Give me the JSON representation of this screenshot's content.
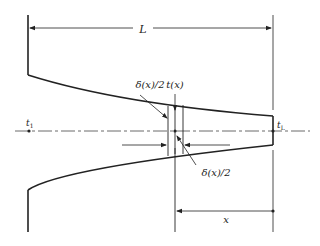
{
  "diagram": {
    "title": "",
    "labels": {
      "length": "L",
      "half_thickness_upper": "δ(x)/2",
      "half_thickness_lower": "δ(x)/2",
      "element": "t(x)",
      "base_temp": "t",
      "base_temp_sub": "1",
      "tip_temp": "t",
      "tip_temp_sub": "L",
      "distance": "x"
    },
    "colors": {
      "stroke": "#222222",
      "background": "#ffffff"
    }
  }
}
